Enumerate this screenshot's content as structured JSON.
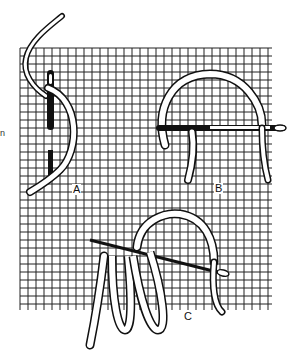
{
  "figure": {
    "labels": {
      "a": "A",
      "b": "B",
      "c": "C"
    },
    "stray_text": "n",
    "colors": {
      "ink": "#111111",
      "background": "#ffffff",
      "thread_fill": "#ffffff"
    },
    "grid": {
      "x_start": 20,
      "x_end": 272,
      "y_start": 48,
      "y_end": 310,
      "spacing": 8
    }
  }
}
